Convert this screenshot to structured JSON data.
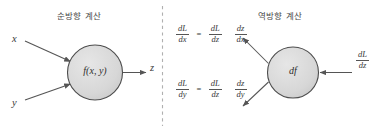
{
  "figure": {
    "divider": "vertical-dashed-line",
    "panels": {
      "forward": {
        "title": "순방향 계산",
        "inputs": [
          "x",
          "y"
        ],
        "node": "f(x, y)",
        "output": "z"
      },
      "backward": {
        "title": "역방향 계산",
        "node": "df",
        "output_gradient": {
          "num": "dL",
          "den": "dz"
        },
        "equations": [
          {
            "id": "dx",
            "lhs": {
              "num": "dL",
              "den": "dx"
            },
            "eq": "=",
            "rhs1": {
              "num": "dL",
              "den": "dz"
            },
            "rhs2": {
              "num": "dz",
              "den": "dx"
            }
          },
          {
            "id": "dy",
            "lhs": {
              "num": "dL",
              "den": "dy"
            },
            "eq": "=",
            "rhs1": {
              "num": "dL",
              "den": "dz"
            },
            "rhs2": {
              "num": "dz",
              "den": "dy"
            }
          }
        ]
      }
    },
    "colors": {
      "node_fill": "#d8d8d8",
      "node_stroke": "#4d4d4d",
      "arrow": "#555555",
      "text": "#3a3a3a",
      "divider": "#aaaaaa",
      "background": "#ffffff"
    }
  }
}
